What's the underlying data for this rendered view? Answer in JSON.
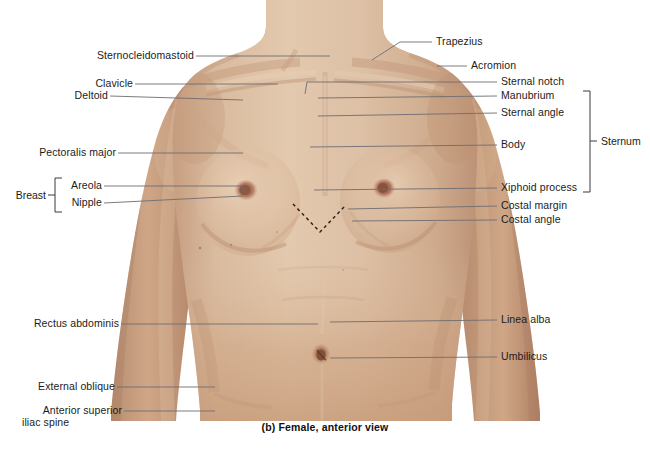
{
  "figure": {
    "caption": "(b) Female, anterior view",
    "colors": {
      "background": "#ffffff",
      "leader_line": "#6d6d73",
      "label_text": "#1b1b1b",
      "skin_chest": "#d8b89d",
      "skin_abdomen": "#cfa384",
      "skin_shadow": "#b98f74",
      "skin_highlight": "#e7cdb4",
      "nipple": "#9c6450",
      "areola": "#b98069",
      "dashed_marker": "#3a2a22"
    }
  },
  "labels_left": [
    {
      "id": "sternocleidomastoid",
      "text": "Sternocleidomastoid"
    },
    {
      "id": "clavicle",
      "text": "Clavicle"
    },
    {
      "id": "deltoid",
      "text": "Deltoid"
    },
    {
      "id": "pectoralis-major",
      "text": "Pectoralis major"
    },
    {
      "id": "areola",
      "text": "Areola"
    },
    {
      "id": "nipple",
      "text": "Nipple"
    },
    {
      "id": "rectus-abdominis",
      "text": "Rectus abdominis"
    },
    {
      "id": "external-oblique",
      "text": "External oblique"
    },
    {
      "id": "anterior-superior-iliac-spine-1",
      "text": "Anterior superior"
    },
    {
      "id": "anterior-superior-iliac-spine-2",
      "text": "iliac spine"
    }
  ],
  "labels_right": [
    {
      "id": "trapezius",
      "text": "Trapezius"
    },
    {
      "id": "acromion",
      "text": "Acromion"
    },
    {
      "id": "sternal-notch",
      "text": "Sternal notch"
    },
    {
      "id": "manubrium",
      "text": "Manubrium"
    },
    {
      "id": "sternal-angle",
      "text": "Sternal angle"
    },
    {
      "id": "body",
      "text": "Body"
    },
    {
      "id": "xiphoid-process",
      "text": "Xiphoid process"
    },
    {
      "id": "costal-margin",
      "text": "Costal margin"
    },
    {
      "id": "costal-angle",
      "text": "Costal angle"
    },
    {
      "id": "linea-alba",
      "text": "Linea alba"
    },
    {
      "id": "umbilicus",
      "text": "Umbilicus"
    }
  ],
  "groups": [
    {
      "id": "breast",
      "text": "Breast",
      "members": [
        "Areola",
        "Nipple"
      ],
      "side": "left"
    },
    {
      "id": "sternum",
      "text": "Sternum",
      "members": [
        "Manubrium",
        "Sternal angle",
        "Body",
        "Xiphoid process"
      ],
      "side": "right"
    }
  ]
}
